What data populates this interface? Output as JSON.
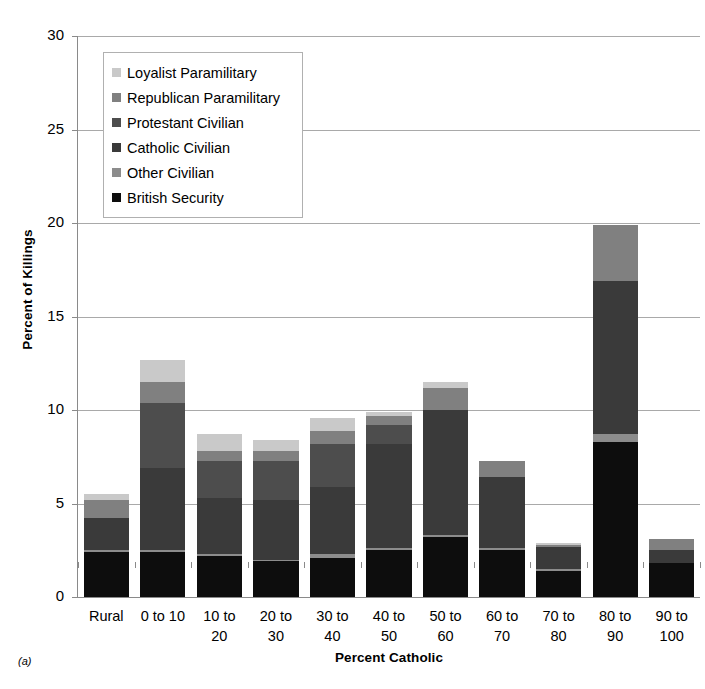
{
  "panel_label": "(a)",
  "chart_data": {
    "type": "bar",
    "subtype": "stacked-bar",
    "title": "",
    "xlabel": "Percent Catholic",
    "ylabel": "Percent of Killings",
    "ylim": [
      0,
      30
    ],
    "ytick_step": 5,
    "yticks": [
      0,
      5,
      10,
      15,
      20,
      25,
      30
    ],
    "grid": "horizontal",
    "legend_position": "top-left-inside",
    "stack_order_bottom_to_top": [
      "British Security",
      "Other Civilian",
      "Catholic Civilian",
      "Protestant Civilian",
      "Republican Paramilitary",
      "Loyalist Paramilitary"
    ],
    "categories": [
      "Rural",
      "0 to 10",
      "10 to\n20",
      "20 to\n30",
      "30 to\n40",
      "40 to\n50",
      "50 to\n60",
      "60 to\n70",
      "70 to\n80",
      "80 to\n90",
      "90 to\n100"
    ],
    "series": [
      {
        "name": "British Security",
        "color": "#0d0d0d",
        "values": [
          2.4,
          2.4,
          2.2,
          1.9,
          2.1,
          2.5,
          3.2,
          2.5,
          1.4,
          8.3,
          1.8
        ]
      },
      {
        "name": "Other Civilian",
        "color": "#8c8c8c",
        "values": [
          0.1,
          0.1,
          0.1,
          0.1,
          0.2,
          0.1,
          0.1,
          0.1,
          0.1,
          0.4,
          0.0
        ]
      },
      {
        "name": "Catholic Civilian",
        "color": "#3a3a3a",
        "values": [
          1.7,
          4.4,
          3.0,
          3.2,
          3.6,
          5.6,
          6.7,
          3.8,
          1.2,
          8.2,
          0.7
        ]
      },
      {
        "name": "Protestant Civilian",
        "color": "#4d4d4d",
        "values": [
          0.0,
          3.5,
          2.0,
          2.1,
          2.3,
          1.0,
          0.0,
          0.0,
          0.0,
          0.0,
          0.0
        ]
      },
      {
        "name": "Republican Paramilitary",
        "color": "#808080",
        "values": [
          1.0,
          1.1,
          0.5,
          0.5,
          0.7,
          0.5,
          1.2,
          0.9,
          0.1,
          3.0,
          0.6
        ]
      },
      {
        "name": "Loyalist Paramilitary",
        "color": "#c9c9c9",
        "values": [
          0.3,
          1.2,
          0.9,
          0.6,
          0.7,
          0.2,
          0.3,
          0.0,
          0.1,
          0.0,
          0.0
        ]
      }
    ],
    "totals": [
      5.5,
      12.7,
      8.7,
      8.4,
      9.6,
      9.9,
      11.5,
      7.3,
      2.9,
      19.9,
      3.1
    ]
  },
  "legend": {
    "items": [
      {
        "label": "Loyalist Paramilitary",
        "color": "#c9c9c9"
      },
      {
        "label": "Republican Paramilitary",
        "color": "#808080"
      },
      {
        "label": "Protestant Civilian",
        "color": "#4d4d4d"
      },
      {
        "label": "Catholic Civilian",
        "color": "#3a3a3a"
      },
      {
        "label": "Other Civilian",
        "color": "#8c8c8c"
      },
      {
        "label": "British Security",
        "color": "#0d0d0d"
      }
    ]
  }
}
